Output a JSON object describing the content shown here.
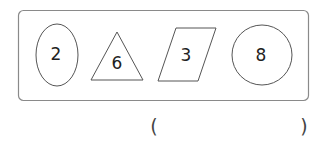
{
  "puzzle": {
    "shapes": [
      {
        "type": "ellipse",
        "label": "2"
      },
      {
        "type": "triangle",
        "label": "6"
      },
      {
        "type": "parallelogram",
        "label": "3"
      },
      {
        "type": "circle",
        "label": "8"
      }
    ],
    "answer": {
      "open_paren": "(",
      "close_paren": ")",
      "value": ""
    }
  }
}
